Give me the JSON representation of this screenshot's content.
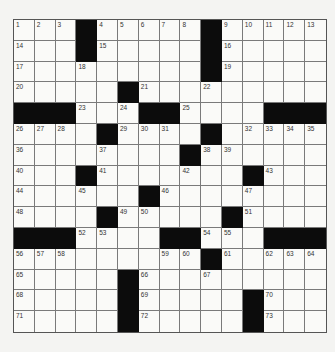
{
  "puzzle": {
    "size": 15,
    "rows": [
      "...#.....#.....",
      "...#.....#.....",
      ".........#.....",
      ".....#.........",
      "###...##....###",
      "....#....#.....",
      "........#......",
      "...#.......#...",
      "......#........",
      "....#.....#....",
      "###....##...###",
      ".........#.....",
      ".....#.........",
      ".....#.....#...",
      ".....#.....#..."
    ],
    "numbers": [
      [
        1,
        2,
        3,
        null,
        4,
        5,
        6,
        7,
        8,
        null,
        9,
        10,
        11,
        12,
        13
      ],
      [
        14,
        null,
        null,
        null,
        15,
        null,
        null,
        null,
        null,
        null,
        16,
        null,
        null,
        null,
        null
      ],
      [
        17,
        null,
        null,
        18,
        null,
        null,
        null,
        null,
        null,
        null,
        19,
        null,
        null,
        null,
        null
      ],
      [
        20,
        null,
        null,
        null,
        null,
        null,
        21,
        null,
        null,
        22,
        null,
        null,
        null,
        null,
        null
      ],
      [
        null,
        null,
        null,
        23,
        null,
        24,
        null,
        null,
        25,
        null,
        null,
        null,
        null,
        null,
        null
      ],
      [
        26,
        27,
        28,
        null,
        null,
        29,
        30,
        31,
        null,
        null,
        null,
        32,
        33,
        34,
        35
      ],
      [
        36,
        null,
        null,
        null,
        37,
        null,
        null,
        null,
        null,
        38,
        39,
        null,
        null,
        null,
        null
      ],
      [
        40,
        null,
        null,
        null,
        41,
        null,
        null,
        null,
        42,
        null,
        null,
        null,
        43,
        null,
        null
      ],
      [
        44,
        null,
        null,
        45,
        null,
        null,
        null,
        46,
        null,
        null,
        null,
        47,
        null,
        null,
        null
      ],
      [
        48,
        null,
        null,
        null,
        null,
        49,
        50,
        null,
        null,
        null,
        null,
        51,
        null,
        null,
        null
      ],
      [
        null,
        null,
        null,
        52,
        53,
        null,
        null,
        null,
        null,
        54,
        55,
        null,
        null,
        null,
        null
      ],
      [
        56,
        57,
        58,
        null,
        null,
        null,
        null,
        59,
        60,
        null,
        61,
        null,
        62,
        63,
        64
      ],
      [
        65,
        null,
        null,
        null,
        null,
        null,
        66,
        null,
        null,
        67,
        null,
        null,
        null,
        null,
        null
      ],
      [
        68,
        null,
        null,
        null,
        null,
        null,
        69,
        null,
        null,
        null,
        null,
        null,
        70,
        null,
        null
      ],
      [
        71,
        null,
        null,
        null,
        null,
        null,
        72,
        null,
        null,
        null,
        null,
        null,
        73,
        null,
        null
      ]
    ]
  },
  "colors": {
    "block": "#0c0c0c",
    "cell": "#fafaf8",
    "line": "#7a7a7a"
  }
}
